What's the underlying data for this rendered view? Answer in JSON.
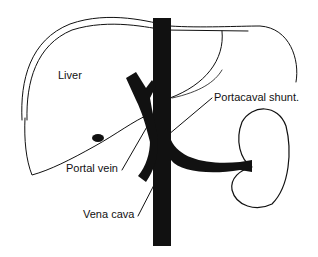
{
  "diagram": {
    "colors": {
      "background": "#ffffff",
      "ink": "#111111"
    },
    "labels": {
      "liver": "Liver",
      "portacaval_shunt": "Portacaval shunt.",
      "portal_vein": "Portal vein",
      "vena_cava": "Vena cava"
    },
    "structures": [
      "liver",
      "vena-cava",
      "portal-vein",
      "portacaval-shunt",
      "kidney",
      "renal-vein"
    ]
  }
}
